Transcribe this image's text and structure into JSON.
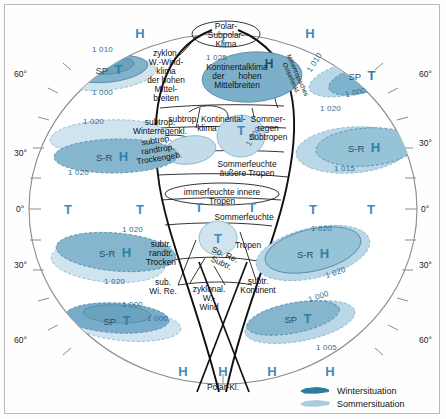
{
  "diagram": {
    "title_visible": false,
    "colors": {
      "winter_fill": "#3f86a8",
      "winter_fill_light": "#6fa9c4",
      "summer_fill": "#b7d6e6",
      "summer_fill_pale": "#d3e6f0",
      "marker_blue": "#3f8cba",
      "pressure_text": "#2f6f97",
      "outline": "#1a1a1a",
      "frame": "#b9b9b9"
    },
    "legend": {
      "items": [
        {
          "key": "winter",
          "label": "Wintersituation",
          "swatch": "winter_fill"
        },
        {
          "key": "summer",
          "label": "Sommersituation",
          "swatch": "summer_fill"
        }
      ]
    },
    "latitude_labels_left": [
      {
        "text": "60°",
        "y": 74
      },
      {
        "text": "30°",
        "y": 153
      },
      {
        "text": "0°",
        "y": 209
      },
      {
        "text": "30°",
        "y": 265
      },
      {
        "text": "60°",
        "y": 340
      }
    ],
    "latitude_labels_right": [
      {
        "text": "60°",
        "y": 74
      },
      {
        "text": "30°",
        "y": 143
      },
      {
        "text": "0°",
        "y": 209
      },
      {
        "text": "30°",
        "y": 265
      },
      {
        "text": "60°",
        "y": 340
      }
    ],
    "pressure_markers": [
      {
        "value": "1 010",
        "x": 92,
        "y": 49,
        "rot": 0
      },
      {
        "value": "1 000",
        "x": 92,
        "y": 93,
        "rot": 0
      },
      {
        "value": "1 020",
        "x": 83,
        "y": 121,
        "rot": 0
      },
      {
        "value": "1 020",
        "x": 68,
        "y": 172,
        "rot": 0
      },
      {
        "value": "1 025",
        "x": 217,
        "y": 57,
        "rot": 0
      },
      {
        "value": "1 000",
        "x": 252,
        "y": 136,
        "rot": -58
      },
      {
        "value": "1 010",
        "x": 313,
        "y": 62,
        "rot": -58
      },
      {
        "value": "1 000",
        "x": 353,
        "y": 92,
        "rot": -12
      },
      {
        "value": "1 020",
        "x": 329,
        "y": 108,
        "rot": 0
      },
      {
        "value": "1 015",
        "x": 343,
        "y": 168,
        "rot": 0
      },
      {
        "value": "1 020",
        "x": 132,
        "y": 229,
        "rot": 0
      },
      {
        "value": "1 020",
        "x": 113,
        "y": 281,
        "rot": 0
      },
      {
        "value": "1 000",
        "x": 131,
        "y": 304,
        "rot": 0
      },
      {
        "value": "1 000",
        "x": 155,
        "y": 318,
        "rot": 0
      },
      {
        "value": "1 020",
        "x": 320,
        "y": 228,
        "rot": 0
      },
      {
        "value": "1 020",
        "x": 334,
        "y": 272,
        "rot": -18
      },
      {
        "value": "1 000",
        "x": 317,
        "y": 296,
        "rot": -18
      },
      {
        "value": "1 005",
        "x": 325,
        "y": 347,
        "rot": 0
      }
    ],
    "cell_markers": [
      {
        "label": "H",
        "x": 140,
        "y": 33
      },
      {
        "label": "H",
        "x": 310,
        "y": 33
      },
      {
        "label": "H",
        "x": 28,
        "y": 33
      },
      {
        "label": "T",
        "x": 68,
        "y": 209
      },
      {
        "label": "T",
        "x": 140,
        "y": 209
      },
      {
        "label": "T",
        "x": 199,
        "y": 207
      },
      {
        "label": "T",
        "x": 252,
        "y": 207
      },
      {
        "label": "T",
        "x": 313,
        "y": 209
      },
      {
        "label": "T",
        "x": 371,
        "y": 209
      },
      {
        "label": "H",
        "x": 183,
        "y": 371
      },
      {
        "label": "H",
        "x": 223,
        "y": 371
      },
      {
        "label": "H",
        "x": 272,
        "y": 371
      },
      {
        "label": "H",
        "x": 330,
        "y": 371
      }
    ],
    "pressure_cell_labels": [
      {
        "text": "SP",
        "sub": "T",
        "x": 109,
        "y": 69
      },
      {
        "text": "S-R",
        "sub": "H",
        "x": 112,
        "y": 156
      },
      {
        "text": "SP",
        "sub": "T",
        "x": 362,
        "y": 75
      },
      {
        "text": "S-R",
        "sub": "H",
        "x": 362,
        "y": 145
      },
      {
        "text": "S-R",
        "sub": "H",
        "x": 115,
        "y": 252
      },
      {
        "text": "SP",
        "sub": "T",
        "x": 117,
        "y": 320
      },
      {
        "text": "S-R",
        "sub": "H",
        "x": 313,
        "y": 253
      },
      {
        "text": "SP",
        "sub": "T",
        "x": 298,
        "y": 318
      }
    ],
    "zone_labels": [
      {
        "id": "polar-subpolar",
        "text": "Polar-\nSubpolar-\nKlima",
        "x": 226,
        "y": 22
      },
      {
        "id": "zyklon-west",
        "text": "zyklon.\nW.-Wind-\nklima\nder hohen\nMittel-\nbreiten",
        "x": 166,
        "y": 49
      },
      {
        "id": "kontinental-hohen",
        "text": "Kontinentalklima\nder      hohen\nMittelbreiten",
        "x": 237,
        "y": 63
      },
      {
        "id": "mitteltrop-ost",
        "text": "Mittertropisches\nOstseitenkl.",
        "x": 294,
        "y": 70
      },
      {
        "id": "subtrop-winter",
        "text": "subtrop.\nWinterregenkl.",
        "x": 160,
        "y": 118
      },
      {
        "id": "subtrop-kont",
        "text": "subtrop. Kontinental-\nklima",
        "x": 200,
        "y": 118
      },
      {
        "id": "sommerregen-sub",
        "text": "Sommer-\nregen\nSubtropen",
        "x": 265,
        "y": 118
      },
      {
        "id": "subtrop-randtrop",
        "text": "subtrop.\nrandtrop.\nTrockengeb.",
        "x": 158,
        "y": 138
      },
      {
        "id": "sommerf-aeussere",
        "text": "Sommerfeuchte\näußere Tropen",
        "x": 247,
        "y": 163
      },
      {
        "id": "immerfeuchte",
        "text": "immerfeuchte innere\nTropen",
        "x": 222,
        "y": 190
      },
      {
        "id": "sommerfeuchte2",
        "text": "Sommerfeuchte",
        "x": 244,
        "y": 213
      },
      {
        "id": "tropen2",
        "text": "Tropen",
        "x": 246,
        "y": 240
      },
      {
        "id": "subtr-randtr",
        "text": "subtr.\nrandtr.\nTrocken",
        "x": 157,
        "y": 244
      },
      {
        "id": "so-re-subtr",
        "text": "So. Re.\nSubtr.",
        "x": 221,
        "y": 252
      },
      {
        "id": "sub-wi-re",
        "text": "sub.\nWi. Re.",
        "x": 162,
        "y": 281
      },
      {
        "id": "subtr-kontinent",
        "text": "subtr.\nKontinent",
        "x": 255,
        "y": 279
      },
      {
        "id": "zyklonal-w-wind",
        "text": "zyklonal.\nW.-\nWind",
        "x": 209,
        "y": 289
      },
      {
        "id": "polar-kl",
        "text": "Polar-Kl.",
        "x": 223,
        "y": 385
      }
    ]
  }
}
